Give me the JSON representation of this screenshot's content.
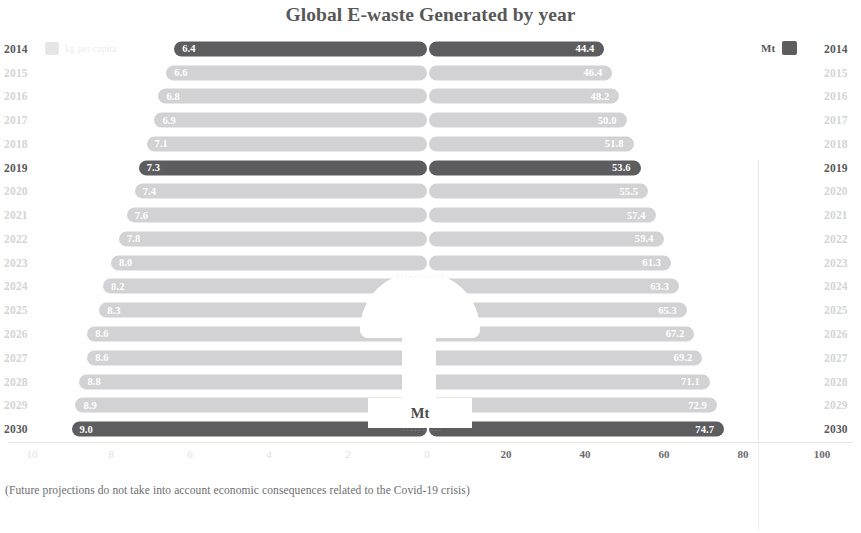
{
  "chart_data": {
    "type": "bar",
    "subtype": "diverging-butterfly",
    "title": "Global E-waste Generated by year",
    "footnote": "(Future projections do not take into account economic consequences related to the Covid-19 crisis)",
    "categories": [
      "2014",
      "2015",
      "2016",
      "2017",
      "2018",
      "2019",
      "2020",
      "2021",
      "2022",
      "2023",
      "2024",
      "2025",
      "2026",
      "2027",
      "2028",
      "2029",
      "2030"
    ],
    "series": [
      {
        "name": "kg per capita",
        "side": "left",
        "unit": "kg",
        "values": [
          6.4,
          6.6,
          6.8,
          6.9,
          7.1,
          7.3,
          7.4,
          7.6,
          7.8,
          8.0,
          8.2,
          8.3,
          8.6,
          8.6,
          8.8,
          8.9,
          9.0
        ],
        "labels": [
          "6.4",
          "6.6",
          "6.8",
          "6.9",
          "7.1",
          "7.3",
          "7.4",
          "7.6",
          "7.8",
          "8.0",
          "8.2",
          "8.3",
          "8.6",
          "8.6",
          "8.8",
          "8.9",
          "9.0"
        ],
        "axis_ticks": [
          10,
          8,
          6,
          4,
          2,
          0
        ],
        "axis_tick_labels": [
          "10",
          "8",
          "6",
          "4",
          "2",
          "0"
        ],
        "axis_max": 10,
        "color_dark": "#5d5d60",
        "color_light": "#d2d2d4"
      },
      {
        "name": "Mt",
        "side": "right",
        "unit": "Mt",
        "values": [
          44.4,
          46.4,
          48.2,
          50.0,
          51.8,
          53.6,
          55.5,
          57.4,
          59.4,
          61.3,
          63.3,
          65.3,
          67.2,
          69.2,
          71.1,
          72.9,
          74.7
        ],
        "labels": [
          "44.4",
          "46.4",
          "48.2",
          "50.0",
          "51.8",
          "53.6",
          "55.5",
          "57.4",
          "59.4",
          "61.3",
          "63.3",
          "65.3",
          "67.2",
          "69.2",
          "71.1",
          "72.9",
          "74.7"
        ],
        "axis_ticks": [
          0,
          20,
          40,
          60,
          80,
          100
        ],
        "axis_tick_labels": [
          "0",
          "20",
          "40",
          "60",
          "80",
          "100"
        ],
        "axis_max": 100,
        "color_dark": "#5d5d60",
        "color_light": "#d2d2d4"
      }
    ],
    "highlighted_rows": [
      "2014",
      "2019",
      "2030"
    ],
    "faded_rows": [
      "2015",
      "2016",
      "2017",
      "2018",
      "2020",
      "2021",
      "2022",
      "2023",
      "2024",
      "2025",
      "2026",
      "2027",
      "2028",
      "2029"
    ],
    "grid": false,
    "legend_position": "top-left and top-right"
  },
  "legend_left": {
    "label": "kg per capita",
    "swatch_color": "#e6e6e8"
  },
  "legend_right": {
    "label": "Mt",
    "swatch_color": "#5d5d60"
  },
  "center_overlay": {
    "mt_label": "Mt",
    "arc_text": "· · · · · · · · · · ·",
    "sub_text": "· · · · · · · · · ·"
  }
}
